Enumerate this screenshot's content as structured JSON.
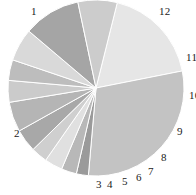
{
  "chart_data": {
    "type": "pie",
    "title": "",
    "subtitle": "",
    "xlabel": "",
    "ylabel": "",
    "legend_position": "none",
    "grid": false,
    "labels_shown_outside": true,
    "start_angle_deg": -76,
    "direction": "clockwise",
    "center_px": [
      96,
      88
    ],
    "radius_px": 88,
    "categories": [
      "1",
      "2",
      "3",
      "4",
      "5",
      "6",
      "7",
      "8",
      "9",
      "10",
      "11",
      "12",
      "13"
    ],
    "values": [
      18.0,
      29.5,
      2.2,
      2.8,
      3.3,
      3.0,
      4.2,
      5.5,
      4.0,
      3.8,
      6.0,
      10.5,
      7.2
    ],
    "value_unit": "percent",
    "colors": [
      "#e6e6e6",
      "#c3c3c3",
      "#9a9a9a",
      "#b8b8b8",
      "#e0e0e0",
      "#cfcfcf",
      "#a8a8a8",
      "#b5b5b5",
      "#cbcbcb",
      "#bdbdbd",
      "#d9d9d9",
      "#a5a5a5",
      "#cccccc"
    ],
    "slice_label_text": [
      "1",
      "2",
      "3",
      "4",
      "5",
      "6",
      "7",
      "8",
      "9",
      "10",
      "11",
      "12",
      ""
    ],
    "slice_label_positions": [
      [
        31,
        6
      ],
      [
        14,
        128
      ],
      [
        96,
        179
      ],
      [
        107,
        179
      ],
      [
        122,
        176
      ],
      [
        136,
        172
      ],
      [
        148,
        166
      ],
      [
        161,
        153
      ],
      [
        178,
        128
      ],
      [
        190,
        92
      ],
      [
        188,
        53
      ],
      [
        159,
        6
      ],
      [
        0,
        0
      ]
    ],
    "separator_color": "#ffffff",
    "separator_width_px": 1,
    "background": "#ffffff"
  },
  "labels": {
    "l1": "1",
    "l2": "2",
    "l3": "3",
    "l4": "4",
    "l5": "5",
    "l6": "6",
    "l7": "7",
    "l8": "8",
    "l9": "9",
    "l10": "10",
    "l11": "11",
    "l12": "12"
  }
}
